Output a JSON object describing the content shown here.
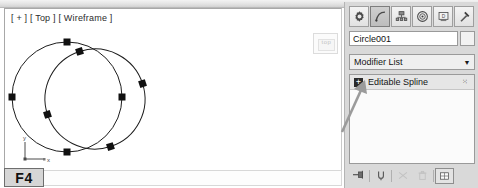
{
  "app": {
    "title": "3ds Max Command Panel",
    "accent_color": "#d9d9d9"
  },
  "viewport": {
    "label": "[ + ] [ Top ] [ Wireframe ]",
    "view_cube_label": "top",
    "axis": {
      "y_label": "y",
      "x_label": "x",
      "z_label": "z"
    },
    "shortcut_badge": "F4",
    "objects": [
      {
        "name": "circle-left",
        "type": "circle",
        "cx": 170,
        "cy": 95,
        "r": 55,
        "rotation": 0
      },
      {
        "name": "circle-right",
        "type": "circle",
        "cx": 197,
        "cy": 97,
        "r": 50,
        "rotation": -18
      }
    ],
    "vertex_count": 8
  },
  "command_panel": {
    "tabs": [
      {
        "name": "create-tab",
        "icon": "gear-icon",
        "label": "Create",
        "active": false
      },
      {
        "name": "modify-tab",
        "icon": "curve-icon",
        "label": "Modify",
        "active": true
      },
      {
        "name": "hierarchy-tab",
        "icon": "hierarchy-icon",
        "label": "Hierarchy",
        "active": false
      },
      {
        "name": "motion-tab",
        "icon": "motion-icon",
        "label": "Motion",
        "active": false
      },
      {
        "name": "display-tab",
        "icon": "display-icon",
        "label": "Display",
        "active": false
      },
      {
        "name": "utilities-tab",
        "icon": "hammer-icon",
        "label": "Utilities",
        "active": false
      }
    ],
    "object_name": {
      "value": "Circle001",
      "placeholder": "Name"
    },
    "modifier_list": {
      "label": "Modifier List",
      "arrow": "▼"
    },
    "stack": {
      "items": [
        {
          "label": "Editable Spline",
          "expander": "+",
          "dots": "⁙"
        }
      ]
    },
    "stack_tools": [
      {
        "name": "pin-stack-button",
        "icon": "pin-icon",
        "enabled": true
      },
      {
        "name": "show-end-result-button",
        "icon": "show-end-result-icon",
        "enabled": true
      },
      {
        "name": "make-unique-button",
        "icon": "make-unique-icon",
        "enabled": false
      },
      {
        "name": "remove-modifier-button",
        "icon": "trash-icon",
        "enabled": false
      },
      {
        "name": "configure-modifier-sets-button",
        "icon": "configure-sets-icon",
        "enabled": true
      }
    ]
  },
  "annotation": {
    "arrow_target": "Editable Spline"
  }
}
